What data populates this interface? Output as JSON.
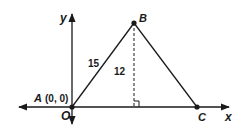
{
  "diagram": {
    "type": "coordinate-geometry-triangle",
    "axes": {
      "x_label": "x",
      "y_label": "y",
      "origin_label": "O"
    },
    "points": {
      "A": {
        "label": "A",
        "coords_label": "(0, 0)"
      },
      "B": {
        "label": "B"
      },
      "C": {
        "label": "C"
      }
    },
    "segments": {
      "AB_length": "15",
      "altitude_length": "12"
    },
    "colors": {
      "stroke": "#1a1a1a",
      "background": "#ffffff"
    }
  }
}
